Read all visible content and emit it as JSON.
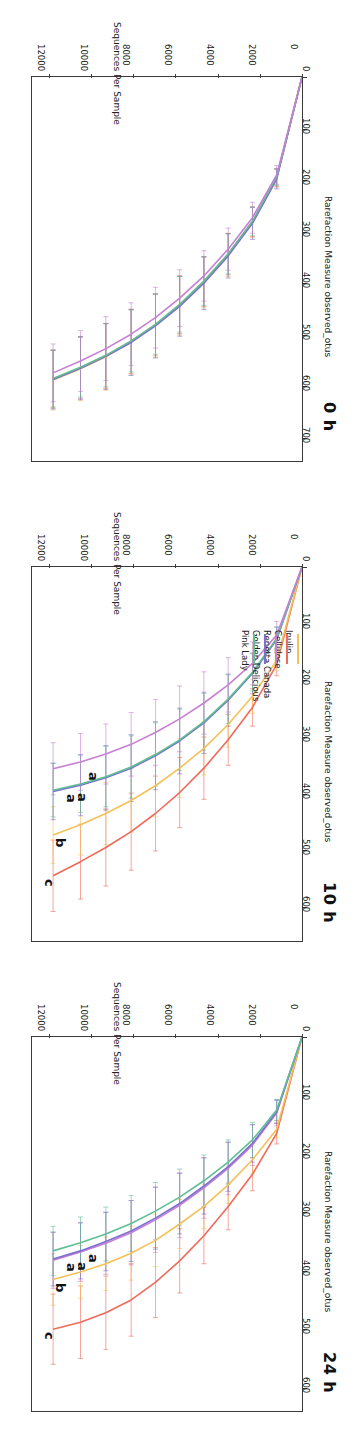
{
  "figure": {
    "rotation_deg": 180,
    "panel_count": 3
  },
  "axes": {
    "xlabel": "Sequences Per Sample",
    "ylabel": "Rarefaction Measure observed_otus",
    "xticks": [
      "0",
      "2000",
      "4000",
      "6000",
      "8000",
      "10000",
      "12000"
    ],
    "xtick_values": [
      0,
      2000,
      4000,
      6000,
      8000,
      10000,
      12000
    ],
    "xlim": [
      0,
      12800
    ]
  },
  "series_colors": {
    "Inulin": "#f3c158",
    "Cellulose": "#ef6a5a",
    "Renetta Canada": "#c77fd4",
    "Golden Delicious": "#7b6fd0",
    "Pink Lady": "#5fbf93"
  },
  "legend": {
    "position": "left-middle-panel",
    "items": [
      {
        "label": "Inulin",
        "color": "#f3c158"
      },
      {
        "label": "Cellulose",
        "color": "#ef6a5a"
      },
      {
        "label": "Renetta Canada",
        "color": "#c77fd4"
      },
      {
        "label": "Golden Delicious",
        "color": "#7b6fd0"
      },
      {
        "label": "Pink Lady",
        "color": "#5fbf93"
      }
    ]
  },
  "chart_data": [
    {
      "id": "panel-24h",
      "type": "line",
      "title": "24 h",
      "xlabel": "Sequences Per Sample",
      "ylabel": "Rarefaction Measure observed_otus",
      "xlim": [
        0,
        12800
      ],
      "ylim": [
        0,
        640
      ],
      "yticks": [
        "0",
        "100",
        "200",
        "300",
        "400",
        "500",
        "600"
      ],
      "ytick_values": [
        0,
        100,
        200,
        300,
        400,
        500,
        600
      ],
      "grid": false,
      "errorbars": true,
      "x": [
        0,
        1200,
        2350,
        3500,
        4650,
        5800,
        6950,
        8100,
        9300,
        10500,
        11800
      ],
      "series": [
        {
          "name": "Cellulose",
          "color": "#ef6a5a",
          "letter": "c",
          "values": [
            0,
            165,
            235,
            290,
            340,
            383,
            420,
            450,
            472,
            488,
            500
          ],
          "err": [
            0,
            18,
            28,
            40,
            48,
            55,
            60,
            62,
            63,
            62,
            60
          ]
        },
        {
          "name": "Inulin",
          "color": "#f3c158",
          "letter": "b",
          "values": [
            0,
            158,
            210,
            253,
            290,
            320,
            348,
            370,
            388,
            402,
            415
          ],
          "err": [
            0,
            15,
            24,
            32,
            38,
            42,
            45,
            46,
            46,
            45,
            44
          ]
        },
        {
          "name": "Renetta Canada",
          "color": "#c77fd4",
          "letter": "a",
          "values": [
            0,
            130,
            185,
            225,
            258,
            288,
            313,
            335,
            353,
            368,
            382
          ],
          "err": [
            0,
            22,
            35,
            45,
            52,
            55,
            56,
            55,
            53,
            50,
            48
          ]
        },
        {
          "name": "Golden Delicious",
          "color": "#7b6fd0",
          "letter": "a",
          "values": [
            0,
            128,
            182,
            222,
            255,
            285,
            310,
            332,
            350,
            366,
            380
          ],
          "err": [
            0,
            20,
            32,
            42,
            48,
            52,
            53,
            52,
            50,
            48,
            46
          ]
        },
        {
          "name": "Pink Lady",
          "color": "#5fbf93",
          "letter": "a",
          "values": [
            0,
            125,
            176,
            214,
            246,
            274,
            298,
            319,
            337,
            352,
            366
          ],
          "err": [
            0,
            18,
            30,
            38,
            44,
            48,
            49,
            48,
            46,
            44,
            42
          ]
        }
      ],
      "group_letters": [
        "a",
        "a",
        "a",
        "b",
        "c"
      ]
    },
    {
      "id": "panel-10h",
      "type": "line",
      "title": "10 h",
      "xlabel": "Sequences Per Sample",
      "ylabel": "Rarefaction Measure observed_otus",
      "xlim": [
        0,
        12800
      ],
      "ylim": [
        0,
        660
      ],
      "yticks": [
        "0",
        "100",
        "200",
        "300",
        "400",
        "500",
        "600"
      ],
      "ytick_values": [
        0,
        100,
        200,
        300,
        400,
        500,
        600
      ],
      "grid": false,
      "errorbars": true,
      "x": [
        0,
        1200,
        2350,
        3500,
        4650,
        5800,
        6950,
        8100,
        9300,
        10500,
        11800
      ],
      "series": [
        {
          "name": "Cellulose",
          "color": "#ef6a5a",
          "letter": "c",
          "values": [
            0,
            172,
            248,
            305,
            355,
            398,
            435,
            467,
            495,
            520,
            545
          ],
          "err": [
            0,
            20,
            33,
            45,
            55,
            62,
            66,
            68,
            68,
            66,
            63
          ]
        },
        {
          "name": "Inulin",
          "color": "#f3c158",
          "letter": "b",
          "values": [
            0,
            165,
            228,
            278,
            320,
            355,
            386,
            412,
            435,
            455,
            473
          ],
          "err": [
            0,
            18,
            30,
            40,
            47,
            52,
            55,
            56,
            55,
            53,
            50
          ]
        },
        {
          "name": "Golden Delicious",
          "color": "#7b6fd0",
          "letter": "a",
          "values": [
            0,
            128,
            188,
            235,
            275,
            307,
            333,
            355,
            372,
            385,
            396
          ],
          "err": [
            0,
            22,
            36,
            46,
            54,
            58,
            60,
            59,
            57,
            54,
            50
          ]
        },
        {
          "name": "Pink Lady",
          "color": "#5fbf93",
          "letter": "a",
          "values": [
            0,
            126,
            186,
            233,
            273,
            305,
            331,
            353,
            370,
            383,
            394
          ],
          "err": [
            0,
            20,
            33,
            43,
            50,
            54,
            56,
            55,
            53,
            50,
            47
          ]
        },
        {
          "name": "Renetta Canada",
          "color": "#c77fd4",
          "letter": "a",
          "values": [
            0,
            120,
            170,
            208,
            240,
            268,
            292,
            313,
            330,
            344,
            356
          ],
          "err": [
            0,
            24,
            38,
            48,
            55,
            58,
            58,
            56,
            53,
            50,
            46
          ]
        }
      ],
      "group_letters": [
        "a",
        "a",
        "a",
        "b",
        "c"
      ]
    },
    {
      "id": "panel-0h",
      "type": "line",
      "title": "0 h",
      "xlabel": "Sequences Per Sample",
      "ylabel": "Rarefaction Measure observed_otus",
      "xlim": [
        0,
        12800
      ],
      "ylim": [
        0,
        745
      ],
      "yticks": [
        "0",
        "100",
        "200",
        "300",
        "400",
        "500",
        "600",
        "700"
      ],
      "ytick_values": [
        0,
        100,
        200,
        300,
        400,
        500,
        600,
        700
      ],
      "grid": false,
      "errorbars": true,
      "x": [
        0,
        1200,
        2350,
        3500,
        4650,
        5800,
        6950,
        8100,
        9300,
        10500,
        11800
      ],
      "series": [
        {
          "name": "Inulin",
          "color": "#f3c158",
          "values": [
            0,
            196,
            282,
            345,
            398,
            443,
            482,
            514,
            543,
            566,
            588
          ],
          "err": [
            0,
            18,
            30,
            42,
            50,
            58,
            62,
            64,
            65,
            62,
            58
          ]
        },
        {
          "name": "Cellulose",
          "color": "#ef6a5a",
          "values": [
            0,
            195,
            281,
            344,
            397,
            442,
            481,
            513,
            541,
            564,
            586
          ],
          "err": [
            0,
            17,
            29,
            40,
            48,
            56,
            60,
            62,
            63,
            60,
            56
          ]
        },
        {
          "name": "Golden Delicious",
          "color": "#7b6fd0",
          "values": [
            0,
            198,
            284,
            347,
            400,
            445,
            483,
            515,
            542,
            565,
            587
          ],
          "err": [
            0,
            19,
            31,
            43,
            51,
            58,
            62,
            64,
            64,
            61,
            57
          ]
        },
        {
          "name": "Pink Lady",
          "color": "#5fbf93",
          "values": [
            0,
            194,
            280,
            343,
            396,
            441,
            480,
            512,
            540,
            563,
            585
          ],
          "err": [
            0,
            16,
            28,
            39,
            47,
            54,
            58,
            60,
            61,
            58,
            55
          ]
        },
        {
          "name": "Renetta Canada",
          "color": "#c77fd4",
          "values": [
            0,
            190,
            273,
            334,
            386,
            429,
            467,
            499,
            527,
            551,
            574
          ],
          "err": [
            0,
            18,
            30,
            41,
            49,
            55,
            59,
            61,
            62,
            59,
            56
          ]
        }
      ],
      "group_letters": []
    }
  ]
}
